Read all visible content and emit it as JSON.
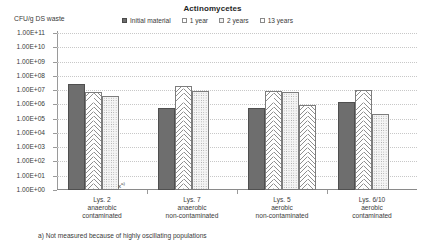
{
  "chart_data": {
    "type": "bar",
    "title": "Actinomycetes",
    "ylabel": "CFU/g DS waste",
    "xlabel": "",
    "scale": "log",
    "grid": true,
    "legend_position": "top",
    "ylim": [
      1,
      100000000000.0
    ],
    "ytick_labels": [
      "1.00E+11",
      "1.00E+10",
      "1.00E+09",
      "1.00E+08",
      "1.00E+07",
      "1.00E+06",
      "1.00E+05",
      "1.00E+04",
      "1.00E+03",
      "1.00E+02",
      "1.00E+01",
      "1.00E+00"
    ],
    "ytick_exponents": [
      11,
      10,
      9,
      8,
      7,
      6,
      5,
      4,
      3,
      2,
      1,
      0
    ],
    "categories": [
      "Lys. 2\nanaerobic\ncontaminated",
      "Lys. 7\nanaerobic\nnon-contaminated",
      "Lys. 5\naerobic\nnon-contaminated",
      "Lys. 6/10\naerobic\ncontaminated"
    ],
    "category_lines": [
      [
        "Lys. 2",
        "anaerobic",
        "contaminated"
      ],
      [
        "Lys. 7",
        "anaerobic",
        "non-contaminated"
      ],
      [
        "Lys. 5",
        "aerobic",
        "non-contaminated"
      ],
      [
        "Lys. 6/10",
        "aerobic",
        "contaminated"
      ]
    ],
    "series": [
      {
        "name": "Initial material",
        "exponents": [
          7.42,
          5.72,
          5.72,
          6.2
        ]
      },
      {
        "name": "1 year",
        "exponents": [
          6.85,
          7.3,
          6.95,
          7.02
        ]
      },
      {
        "name": "2 years",
        "exponents": [
          6.6,
          6.92,
          6.9,
          5.32
        ]
      },
      {
        "name": "13 years",
        "exponents": [
          null,
          null,
          5.95,
          null
        ]
      }
    ],
    "not_measured_marker": "x",
    "not_measured_superscript": "a)",
    "annotations": [
      "a) Not measured because of highly oscillating populations"
    ]
  },
  "legend": {
    "items": [
      {
        "label": "Initial material"
      },
      {
        "label": "1 year"
      },
      {
        "label": "2 years"
      },
      {
        "label": "13 years"
      }
    ]
  },
  "footnote": {
    "text": "a) Not measured because of highly oscillating populations"
  }
}
